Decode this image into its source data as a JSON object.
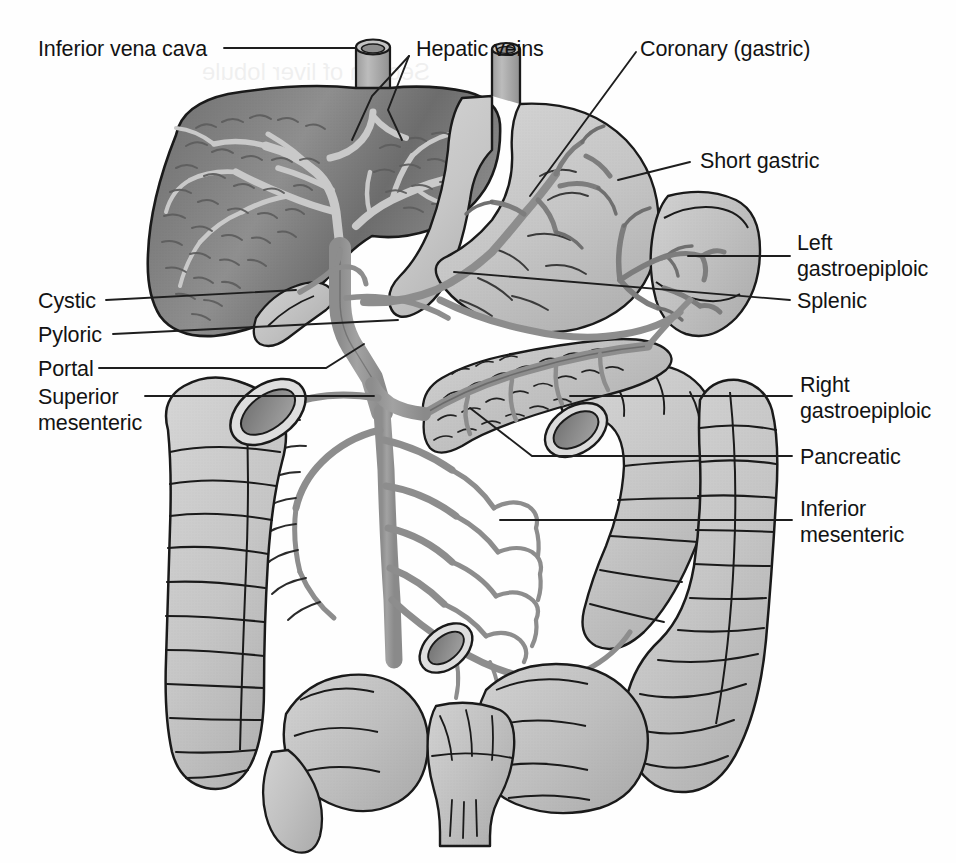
{
  "figure": {
    "type": "anatomical-illustration",
    "background_color": "#fefefe",
    "ink_color": "#131313"
  },
  "palette": {
    "liver_dark": "#757575",
    "liver_mid": "#8c8c8c",
    "vein_gray": "#9a9a9a",
    "organ_light": "#cfcfcf",
    "organ_mid": "#bdbdbd",
    "outline": "#1a1a1a",
    "leader_line": "#1e1e1e"
  },
  "labels": [
    {
      "id": "inferior-vena-cava",
      "text": "Inferior vena cava",
      "side": "left",
      "x": 38,
      "y": 38
    },
    {
      "id": "hepatic-veins",
      "text": "Hepatic veins",
      "side": "right",
      "x": 416,
      "y": 38
    },
    {
      "id": "coronary-gastric",
      "text": "Coronary (gastric)",
      "side": "right",
      "x": 640,
      "y": 38
    },
    {
      "id": "short-gastric",
      "text": "Short gastric",
      "side": "right",
      "x": 697,
      "y": 148
    },
    {
      "id": "left-gastroepiploic",
      "text": "Left\ngastroepiploic",
      "side": "right",
      "x": 797,
      "y": 232
    },
    {
      "id": "splenic",
      "text": "Splenic",
      "side": "right",
      "x": 797,
      "y": 288
    },
    {
      "id": "cystic",
      "text": "Cystic",
      "side": "left",
      "x": 38,
      "y": 282
    },
    {
      "id": "pyloric",
      "text": "Pyloric",
      "side": "left",
      "x": 38,
      "y": 318
    },
    {
      "id": "portal",
      "text": "Portal",
      "side": "left",
      "x": 38,
      "y": 352
    },
    {
      "id": "superior-mesenteric",
      "text": "Superior\nmesenteric",
      "side": "left",
      "x": 38,
      "y": 386
    },
    {
      "id": "right-gastroepiploic",
      "text": "Right\ngastroepiploic",
      "side": "right",
      "x": 800,
      "y": 380
    },
    {
      "id": "pancreatic",
      "text": "Pancreatic",
      "side": "right",
      "x": 800,
      "y": 443
    },
    {
      "id": "inferior-mesenteric",
      "text": "Inferior\nmesenteric",
      "side": "right",
      "x": 800,
      "y": 497
    }
  ],
  "structures": [
    {
      "id": "liver",
      "name": "Liver",
      "shade": "dark"
    },
    {
      "id": "inferior-vena-cava-vessel",
      "name": "Inferior vena cava",
      "shade": "mid"
    },
    {
      "id": "stomach",
      "name": "Stomach",
      "shade": "light"
    },
    {
      "id": "spleen",
      "name": "Spleen",
      "shade": "light"
    },
    {
      "id": "gallbladder",
      "name": "Gallbladder",
      "shade": "light"
    },
    {
      "id": "pancreas",
      "name": "Pancreas",
      "shade": "light"
    },
    {
      "id": "duodenum",
      "name": "Duodenum",
      "shade": "light"
    },
    {
      "id": "ascending-colon",
      "name": "Ascending colon",
      "shade": "light"
    },
    {
      "id": "descending-colon",
      "name": "Descending colon",
      "shade": "light"
    },
    {
      "id": "small-intestine",
      "name": "Small intestine",
      "shade": "light"
    },
    {
      "id": "rectum",
      "name": "Rectum",
      "shade": "light"
    },
    {
      "id": "portal-vein",
      "name": "Portal vein",
      "shade": "vein"
    },
    {
      "id": "superior-mesenteric-vein",
      "name": "Superior mesenteric vein",
      "shade": "vein"
    },
    {
      "id": "inferior-mesenteric-vein",
      "name": "Inferior mesenteric vein",
      "shade": "vein"
    },
    {
      "id": "splenic-vein",
      "name": "Splenic vein",
      "shade": "vein"
    }
  ]
}
